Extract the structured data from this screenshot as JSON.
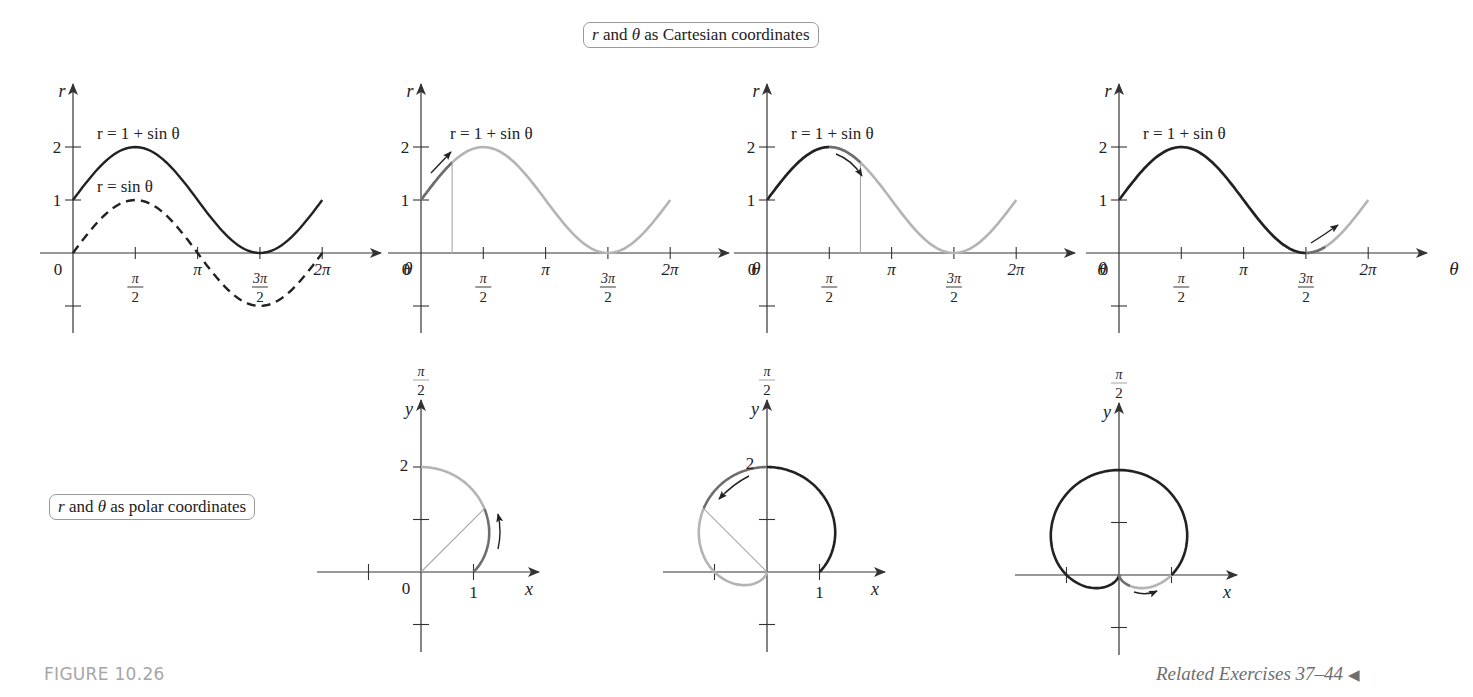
{
  "figure": {
    "label": "FIGURE 10.26",
    "related_exercises": "Related Exercises 37–44",
    "related_marker": "◀"
  },
  "callouts": {
    "cartesian": {
      "prefix": "r",
      "mid1": " and ",
      "theta": "θ",
      "suffix": " as Cartesian coordinates"
    },
    "polar": {
      "prefix": "r",
      "mid1": " and ",
      "theta": "θ",
      "suffix": " as polar coordinates"
    }
  },
  "colors": {
    "ink": "#222222",
    "active": "#6e6e6e",
    "faded": "#b4b4b4",
    "guide": "#a8a8a8",
    "axis": "#333333",
    "caption": "#a6a6a6"
  },
  "chart_data": [
    {
      "type": "line",
      "title": "r = 1 + sin θ and r = sin θ (Cartesian)",
      "xlabel": "θ",
      "ylabel": "r",
      "xticks": [
        "0",
        "π/2",
        "π",
        "3π/2",
        "2π"
      ],
      "yticks": [
        "1",
        "2"
      ],
      "xlim": [
        0,
        6.2832
      ],
      "ylim": [
        -1,
        2.5
      ],
      "series": [
        {
          "name": "r = 1 + sin θ",
          "style": "solid",
          "x": [
            0,
            0.7854,
            1.5708,
            2.3562,
            3.1416,
            3.927,
            4.7124,
            5.4978,
            6.2832
          ],
          "values": [
            1,
            1.707,
            2,
            1.707,
            1,
            0.293,
            0,
            0.293,
            1
          ]
        },
        {
          "name": "r = sin θ",
          "style": "dashed",
          "x": [
            0,
            0.7854,
            1.5708,
            2.3562,
            3.1416,
            3.927,
            4.7124,
            5.4978,
            6.2832
          ],
          "values": [
            0,
            0.707,
            1,
            0.707,
            0,
            -0.707,
            -1,
            -0.707,
            0
          ]
        }
      ],
      "labels": [
        "r = 1 + sin θ",
        "r = sin θ"
      ]
    },
    {
      "type": "line",
      "title": "r = 1 + sin θ, tracing 0 ≤ θ ≤ π/2",
      "xlabel": "θ",
      "ylabel": "r",
      "xticks": [
        "0",
        "π/2",
        "π",
        "3π/2",
        "2π"
      ],
      "yticks": [
        "1",
        "2"
      ],
      "highlight_range": [
        0,
        0.7854
      ],
      "traced_before": null,
      "guide_at": 0.7854,
      "series": [
        {
          "name": "r = 1 + sin θ",
          "x": [
            0,
            1.5708,
            3.1416,
            4.7124,
            6.2832
          ],
          "values": [
            1,
            2,
            1,
            0,
            1
          ]
        }
      ]
    },
    {
      "type": "line",
      "title": "r = 1 + sin θ, tracing π/2 ≤ θ ≤ π",
      "xlabel": "θ",
      "ylabel": "r",
      "xticks": [
        "0",
        "π/2",
        "π",
        "3π/2",
        "2π"
      ],
      "yticks": [
        "1",
        "2"
      ],
      "highlight_range": [
        1.5708,
        2.3562
      ],
      "traced_before": [
        0,
        1.5708
      ],
      "guide_at": 2.3562,
      "series": [
        {
          "name": "r = 1 + sin θ",
          "x": [
            0,
            1.5708,
            3.1416,
            4.7124,
            6.2832
          ],
          "values": [
            1,
            2,
            1,
            0,
            1
          ]
        }
      ]
    },
    {
      "type": "line",
      "title": "r = 1 + sin θ, tracing 3π/2 ≤ θ ≤ 2π",
      "xlabel": "θ",
      "ylabel": "r",
      "xticks": [
        "0",
        "π/2",
        "π",
        "3π/2",
        "2π"
      ],
      "yticks": [
        "1",
        "2"
      ],
      "highlight_range": [
        4.7124,
        5.2
      ],
      "traced_before": [
        0,
        4.7124
      ],
      "guide_at": null,
      "series": [
        {
          "name": "r = 1 + sin θ",
          "x": [
            0,
            1.5708,
            3.1416,
            4.7124,
            6.2832
          ],
          "values": [
            1,
            2,
            1,
            0,
            1
          ]
        }
      ]
    },
    {
      "type": "line",
      "title": "Polar: cardioid r = 1 + sin θ, 0 ≤ θ ≤ π/2",
      "xlabel": "x",
      "ylabel": "y",
      "angle_label": "π/2",
      "xticks": [
        "0",
        "1"
      ],
      "yticks": [
        "2"
      ],
      "highlight_range": [
        0,
        0.7854
      ],
      "traced_before": null,
      "faded_range": [
        0.7854,
        1.5708
      ],
      "guide_at": 0.7854
    },
    {
      "type": "line",
      "title": "Polar: cardioid r = 1 + sin θ, π/2 ≤ θ ≤ π",
      "xlabel": "x",
      "ylabel": "y",
      "angle_label": "π/2",
      "xticks": [
        "1"
      ],
      "yticks": [
        "2"
      ],
      "highlight_range": [
        1.5708,
        2.3562
      ],
      "traced_before": [
        0,
        1.5708
      ],
      "faded_range": [
        2.3562,
        4.7124
      ],
      "guide_at": 2.3562
    },
    {
      "type": "line",
      "title": "Polar: cardioid r = 1 + sin θ, 3π/2 ≤ θ ≤ 2π",
      "xlabel": "x",
      "ylabel": "y",
      "angle_label": "π/2",
      "xticks": [],
      "yticks": [],
      "highlight_range": [
        4.7124,
        5.5
      ],
      "traced_before": [
        0,
        4.7124
      ],
      "faded_range": [
        5.5,
        6.2832
      ],
      "guide_at": null
    }
  ],
  "text": {
    "r": "r",
    "theta": "θ",
    "x": "x",
    "y": "y",
    "zero": "0",
    "one": "1",
    "two": "2",
    "pi": "π",
    "two_pi": "2π",
    "pi_num": "π",
    "three_pi_num": "3π",
    "den": "2",
    "eq_label_full": "r = 1 + sin θ",
    "eq_label_sin": "r = sin θ"
  }
}
